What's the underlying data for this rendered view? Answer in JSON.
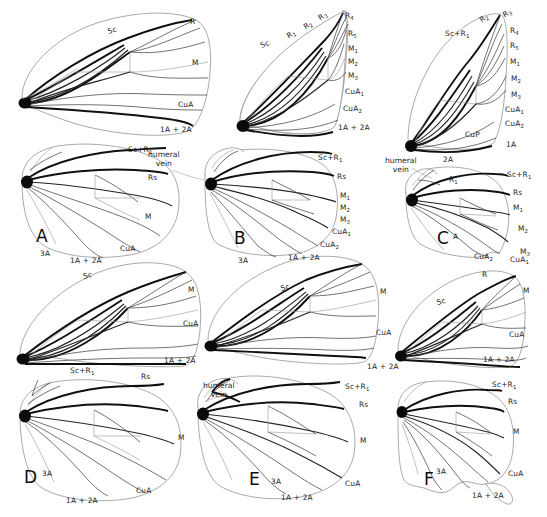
{
  "figure": {
    "background_color": "#ffffff",
    "ink_color": "#1c1c1c",
    "outline_color": "#8e8e8e",
    "panel_count": 6,
    "annotation_humeral": "humeral\nvein"
  },
  "annotations": [
    {
      "name": "humeral-vein-a",
      "text_line1": "humeral",
      "text_line2": "vein",
      "x": 148,
      "y": 150
    },
    {
      "name": "humeral-vein-c",
      "text_line1": "humeral",
      "text_line2": "vein",
      "x": 385,
      "y": 156
    },
    {
      "name": "humeral-vein-e",
      "text_line1": "humeral",
      "text_line2": "vein",
      "x": 203,
      "y": 381
    }
  ],
  "panels": [
    {
      "id": "A",
      "letter": "A",
      "letter_x": 36,
      "letter_y": 228,
      "forewing": {
        "name": "forewing-a",
        "labels": [
          {
            "text": "Sc",
            "sub": "",
            "x": 109,
            "y": 28,
            "rot": -18
          },
          {
            "text": "R",
            "sub": "",
            "x": 190,
            "y": 18,
            "rot": 0
          },
          {
            "text": "M",
            "sub": "",
            "x": 192,
            "y": 59,
            "rot": 0
          },
          {
            "text": "CuA",
            "sub": "",
            "x": 178,
            "y": 101,
            "rot": 0
          },
          {
            "text": "1A + 2A",
            "sub": "",
            "x": 160,
            "y": 126,
            "rot": 0
          }
        ]
      },
      "hindwing": {
        "name": "hindwing-a",
        "labels": [
          {
            "text": "Sc+R",
            "sub": "1",
            "x": 128,
            "y": 146,
            "rot": 0
          },
          {
            "text": "Rs",
            "sub": "",
            "x": 148,
            "y": 174,
            "rot": 0
          },
          {
            "text": "M",
            "sub": "",
            "x": 145,
            "y": 213,
            "rot": 0
          },
          {
            "text": "CuA",
            "sub": "",
            "x": 120,
            "y": 245,
            "rot": 0
          },
          {
            "text": "1A + 2A",
            "sub": "",
            "x": 70,
            "y": 257,
            "rot": 0
          },
          {
            "text": "3A",
            "sub": "",
            "x": 40,
            "y": 250,
            "rot": 0
          }
        ]
      }
    },
    {
      "id": "B",
      "letter": "B",
      "letter_x": 234,
      "letter_y": 230,
      "forewing": {
        "name": "forewing-b",
        "labels": [
          {
            "text": "Sc",
            "sub": "",
            "x": 262,
            "y": 42,
            "rot": -22
          },
          {
            "text": "R",
            "sub": "1",
            "x": 290,
            "y": 32,
            "rot": -30
          },
          {
            "text": "R",
            "sub": "2",
            "x": 307,
            "y": 23,
            "rot": -32
          },
          {
            "text": "R",
            "sub": "3",
            "x": 322,
            "y": 14,
            "rot": -34
          },
          {
            "text": "R",
            "sub": "4",
            "x": 345,
            "y": 12,
            "rot": 0
          },
          {
            "text": "R",
            "sub": "5",
            "x": 348,
            "y": 30,
            "rot": 0
          },
          {
            "text": "M",
            "sub": "1",
            "x": 348,
            "y": 45,
            "rot": 0
          },
          {
            "text": "M",
            "sub": "2",
            "x": 348,
            "y": 58,
            "rot": 0
          },
          {
            "text": "M",
            "sub": "3",
            "x": 348,
            "y": 72,
            "rot": 0
          },
          {
            "text": "CuA",
            "sub": "1",
            "x": 345,
            "y": 88,
            "rot": 0
          },
          {
            "text": "CuA",
            "sub": "2",
            "x": 343,
            "y": 105,
            "rot": 0
          },
          {
            "text": "1A + 2A",
            "sub": "",
            "x": 338,
            "y": 124,
            "rot": 0
          }
        ]
      },
      "hindwing": {
        "name": "hindwing-b",
        "labels": [
          {
            "text": "Sc+R",
            "sub": "1",
            "x": 318,
            "y": 154,
            "rot": 0
          },
          {
            "text": "Rs",
            "sub": "",
            "x": 337,
            "y": 173,
            "rot": 0
          },
          {
            "text": "M",
            "sub": "1",
            "x": 340,
            "y": 192,
            "rot": 0
          },
          {
            "text": "M",
            "sub": "2",
            "x": 340,
            "y": 204,
            "rot": 0
          },
          {
            "text": "M",
            "sub": "3",
            "x": 340,
            "y": 216,
            "rot": 0
          },
          {
            "text": "CuA",
            "sub": "1",
            "x": 332,
            "y": 228,
            "rot": 0
          },
          {
            "text": "CuA",
            "sub": "2",
            "x": 320,
            "y": 241,
            "rot": 0
          },
          {
            "text": "1A + 2A",
            "sub": "",
            "x": 288,
            "y": 254,
            "rot": 0
          },
          {
            "text": "3A",
            "sub": "",
            "x": 238,
            "y": 257,
            "rot": 0
          }
        ]
      }
    },
    {
      "id": "C",
      "letter": "C",
      "letter_x": 437,
      "letter_y": 230,
      "forewing": {
        "name": "forewing-c",
        "labels": [
          {
            "text": "Sc+R",
            "sub": "1",
            "x": 445,
            "y": 30,
            "rot": 0
          },
          {
            "text": "R",
            "sub": "2",
            "x": 483,
            "y": 16,
            "rot": -32
          },
          {
            "text": "R",
            "sub": "3",
            "x": 506,
            "y": 11,
            "rot": -30
          },
          {
            "text": "R",
            "sub": "4",
            "x": 510,
            "y": 27,
            "rot": 0
          },
          {
            "text": "R",
            "sub": "5",
            "x": 510,
            "y": 42,
            "rot": 0
          },
          {
            "text": "M",
            "sub": "1",
            "x": 510,
            "y": 58,
            "rot": 0
          },
          {
            "text": "M",
            "sub": "2",
            "x": 511,
            "y": 75,
            "rot": 0
          },
          {
            "text": "M",
            "sub": "3",
            "x": 511,
            "y": 91,
            "rot": 0
          },
          {
            "text": "CuA",
            "sub": "1",
            "x": 505,
            "y": 106,
            "rot": 0
          },
          {
            "text": "CuA",
            "sub": "2",
            "x": 505,
            "y": 120,
            "rot": 0
          },
          {
            "text": "CuP",
            "sub": "",
            "x": 465,
            "y": 131,
            "rot": 0
          },
          {
            "text": "1A",
            "sub": "",
            "x": 506,
            "y": 141,
            "rot": 0
          },
          {
            "text": "2A",
            "sub": "",
            "x": 443,
            "y": 156,
            "rot": 0
          }
        ]
      },
      "hindwing": {
        "name": "hindwing-c",
        "labels": [
          {
            "text": "R",
            "sub": "1",
            "x": 449,
            "y": 176,
            "rot": 0
          },
          {
            "text": "Sc+R",
            "sub": "1",
            "x": 507,
            "y": 171,
            "rot": 0
          },
          {
            "text": "Rs",
            "sub": "",
            "x": 513,
            "y": 189,
            "rot": 0
          },
          {
            "text": "M",
            "sub": "1",
            "x": 513,
            "y": 204,
            "rot": 0
          },
          {
            "text": "M",
            "sub": "2",
            "x": 518,
            "y": 225,
            "rot": 0
          },
          {
            "text": "M",
            "sub": "3",
            "x": 520,
            "y": 248,
            "rot": 0
          },
          {
            "text": "CuA",
            "sub": "1",
            "x": 510,
            "y": 256,
            "rot": 0
          },
          {
            "text": "CuA",
            "sub": "2",
            "x": 474,
            "y": 253,
            "rot": 0
          },
          {
            "text": "A",
            "sub": "",
            "x": 453,
            "y": 233,
            "rot": 0
          }
        ]
      }
    },
    {
      "id": "D",
      "letter": "D",
      "letter_x": 24,
      "letter_y": 469,
      "forewing": {
        "name": "forewing-d",
        "labels": [
          {
            "text": "Sc",
            "sub": "",
            "x": 84,
            "y": 273,
            "rot": -14
          },
          {
            "text": "M",
            "sub": "",
            "x": 188,
            "y": 286,
            "rot": 0
          },
          {
            "text": "CuA",
            "sub": "",
            "x": 183,
            "y": 320,
            "rot": 0
          },
          {
            "text": "1A + 2A",
            "sub": "",
            "x": 164,
            "y": 357,
            "rot": 0
          }
        ]
      },
      "hindwing": {
        "name": "hindwing-d",
        "labels": [
          {
            "text": "Sc+R",
            "sub": "1",
            "x": 70,
            "y": 367,
            "rot": 0
          },
          {
            "text": "Rs",
            "sub": "",
            "x": 141,
            "y": 373,
            "rot": 0
          },
          {
            "text": "M",
            "sub": "",
            "x": 178,
            "y": 434,
            "rot": 0
          },
          {
            "text": "CuA",
            "sub": "",
            "x": 136,
            "y": 487,
            "rot": 0
          },
          {
            "text": "1A + 2A",
            "sub": "",
            "x": 66,
            "y": 497,
            "rot": 0
          },
          {
            "text": "3A",
            "sub": "",
            "x": 42,
            "y": 470,
            "rot": 0
          }
        ]
      }
    },
    {
      "id": "E",
      "letter": "E",
      "letter_x": 249,
      "letter_y": 471,
      "forewing": {
        "name": "forewing-e",
        "labels": [
          {
            "text": "Sc",
            "sub": "",
            "x": 282,
            "y": 285,
            "rot": -16
          },
          {
            "text": "M",
            "sub": "",
            "x": 380,
            "y": 288,
            "rot": 0
          },
          {
            "text": "CuA",
            "sub": "",
            "x": 376,
            "y": 329,
            "rot": 0
          },
          {
            "text": "1A + 2A",
            "sub": "",
            "x": 367,
            "y": 363,
            "rot": 0
          }
        ]
      },
      "hindwing": {
        "name": "hindwing-e",
        "labels": [
          {
            "text": "Sc+R",
            "sub": "1",
            "x": 345,
            "y": 383,
            "rot": 0
          },
          {
            "text": "Rs",
            "sub": "",
            "x": 359,
            "y": 401,
            "rot": 0
          },
          {
            "text": "M",
            "sub": "",
            "x": 360,
            "y": 437,
            "rot": 0
          },
          {
            "text": "CuA",
            "sub": "",
            "x": 345,
            "y": 480,
            "rot": 0
          },
          {
            "text": "1A + 2A",
            "sub": "",
            "x": 281,
            "y": 494,
            "rot": 0
          },
          {
            "text": "3A",
            "sub": "",
            "x": 271,
            "y": 478,
            "rot": 0
          }
        ]
      }
    },
    {
      "id": "F",
      "letter": "F",
      "letter_x": 424,
      "letter_y": 471,
      "forewing": {
        "name": "forewing-f",
        "labels": [
          {
            "text": "Sc",
            "sub": "",
            "x": 438,
            "y": 299,
            "rot": -16
          },
          {
            "text": "R",
            "sub": "",
            "x": 482,
            "y": 271,
            "rot": 0
          },
          {
            "text": "M",
            "sub": "",
            "x": 523,
            "y": 287,
            "rot": 0
          },
          {
            "text": "CuA",
            "sub": "",
            "x": 509,
            "y": 331,
            "rot": 0
          },
          {
            "text": "1A + 2A",
            "sub": "",
            "x": 483,
            "y": 356,
            "rot": 0
          }
        ]
      },
      "hindwing": {
        "name": "hindwing-f",
        "labels": [
          {
            "text": "Sc+R",
            "sub": "1",
            "x": 492,
            "y": 381,
            "rot": 0
          },
          {
            "text": "Rs",
            "sub": "",
            "x": 508,
            "y": 398,
            "rot": 0
          },
          {
            "text": "M",
            "sub": "",
            "x": 513,
            "y": 428,
            "rot": 0
          },
          {
            "text": "CuA",
            "sub": "",
            "x": 508,
            "y": 470,
            "rot": 0
          },
          {
            "text": "1A + 2A",
            "sub": "",
            "x": 472,
            "y": 492,
            "rot": 0
          },
          {
            "text": "3A",
            "sub": "",
            "x": 436,
            "y": 468,
            "rot": 0
          }
        ]
      }
    }
  ]
}
